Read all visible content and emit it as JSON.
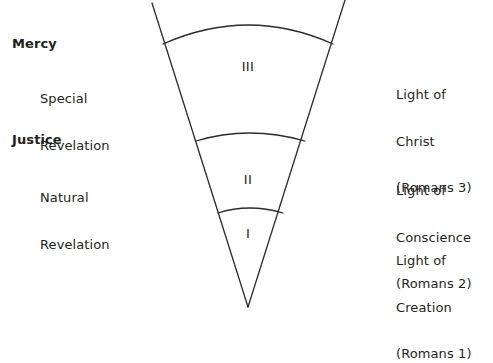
{
  "diagram": {
    "stroke_color": "#2b2b2b",
    "background_color": "#ffffff",
    "text_color": "#231f20",
    "left_column": [
      {
        "heading": "Mercy",
        "description_line1": "Special",
        "description_line2": "Revelation"
      },
      {
        "heading": "Justice",
        "description_line1": "Natural",
        "description_line2": "Revelation"
      }
    ],
    "right_column": [
      {
        "line1": "Light of",
        "line2": "Christ",
        "line3": "(Romans 3)"
      },
      {
        "line1": "Light of",
        "line2": "Conscience",
        "line3": "(Romans 2)"
      },
      {
        "line1": "Light of",
        "line2": "Creation",
        "line3": "(Romans 1)"
      }
    ],
    "cone_sections": [
      {
        "numeral": "III"
      },
      {
        "numeral": "II"
      },
      {
        "numeral": "I"
      }
    ]
  }
}
